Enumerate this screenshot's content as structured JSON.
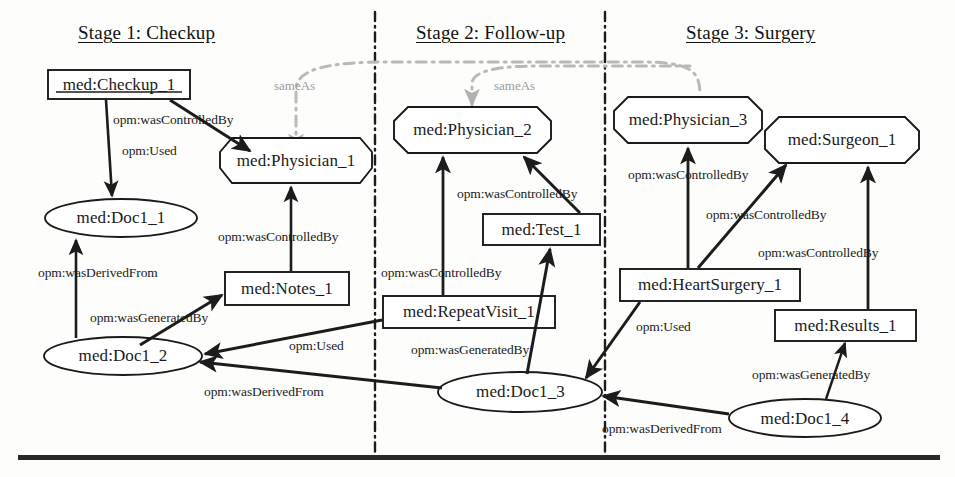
{
  "diagram": {
    "stages": [
      {
        "id": "stage1",
        "label": "Stage 1: Checkup",
        "x": 78,
        "y": 22
      },
      {
        "id": "stage2",
        "label": "Stage 2: Follow-up",
        "x": 416,
        "y": 22
      },
      {
        "id": "stage3",
        "label": "Stage 3: Surgery",
        "x": 686,
        "y": 22
      }
    ],
    "nodes": [
      {
        "id": "checkup1",
        "label": "med:Checkup_1",
        "shape": "rect",
        "x": 48,
        "y": 70,
        "w": 142,
        "h": 29,
        "underline": true
      },
      {
        "id": "physician1",
        "label": "med:Physician_1",
        "shape": "octagon",
        "x": 220,
        "y": 138,
        "w": 152,
        "h": 45
      },
      {
        "id": "doc1_1",
        "label": "med:Doc1_1",
        "shape": "ellipse",
        "x": 45,
        "y": 199,
        "w": 152,
        "h": 38
      },
      {
        "id": "notes1",
        "label": "med:Notes_1",
        "shape": "rect",
        "x": 225,
        "y": 272,
        "w": 124,
        "h": 33
      },
      {
        "id": "doc1_2",
        "label": "med:Doc1_2",
        "shape": "ellipse",
        "x": 44,
        "y": 337,
        "w": 158,
        "h": 38
      },
      {
        "id": "physician2",
        "label": "med:Physician_2",
        "shape": "octagon",
        "x": 394,
        "y": 107,
        "w": 157,
        "h": 46
      },
      {
        "id": "test1",
        "label": "med:Test_1",
        "shape": "rect",
        "x": 483,
        "y": 214,
        "w": 117,
        "h": 31
      },
      {
        "id": "repeatvisit1",
        "label": "med:RepeatVisit_1",
        "shape": "rect",
        "x": 383,
        "y": 296,
        "w": 172,
        "h": 32
      },
      {
        "id": "doc1_3",
        "label": "med:Doc1_3",
        "shape": "ellipse",
        "x": 438,
        "y": 372,
        "w": 165,
        "h": 40
      },
      {
        "id": "physician3",
        "label": "med:Physician_3",
        "shape": "octagon",
        "x": 614,
        "y": 97,
        "w": 148,
        "h": 46
      },
      {
        "id": "surgeon1",
        "label": "med:Surgeon_1",
        "shape": "octagon",
        "x": 765,
        "y": 117,
        "w": 154,
        "h": 46
      },
      {
        "id": "heartsurgery1",
        "label": "med:HeartSurgery_1",
        "shape": "rect",
        "x": 620,
        "y": 269,
        "w": 180,
        "h": 32
      },
      {
        "id": "results1",
        "label": "med:Results_1",
        "shape": "rect",
        "x": 775,
        "y": 310,
        "w": 141,
        "h": 31
      },
      {
        "id": "doc1_4",
        "label": "med:Doc1_4",
        "shape": "ellipse",
        "x": 729,
        "y": 399,
        "w": 152,
        "h": 39
      }
    ],
    "edges": [
      {
        "id": "e1",
        "from": "checkup1",
        "to": "doc1_1",
        "label": "opm:Used",
        "label_x": 122,
        "label_y": 143
      },
      {
        "id": "e2",
        "from": "checkup1",
        "to": "physician1",
        "label": "opm:wasControlledBy",
        "label_x": 113,
        "label_y": 112
      },
      {
        "id": "e3",
        "from": "notes1",
        "to": "physician1",
        "label": "opm:wasControlledBy",
        "label_x": 218,
        "label_y": 229
      },
      {
        "id": "e4",
        "from": "doc1_2",
        "to": "doc1_1",
        "label": "opm:wasDerivedFrom",
        "label_x": 38,
        "label_y": 265
      },
      {
        "id": "e5",
        "from": "doc1_2",
        "to": "notes1",
        "label": "opm:wasGeneratedBy",
        "label_x": 90,
        "label_y": 310
      },
      {
        "id": "e6",
        "from": "repeatvisit1",
        "to": "doc1_2",
        "label": "opm:Used",
        "label_x": 289,
        "label_y": 338
      },
      {
        "id": "e7",
        "from": "repeatvisit1",
        "to": "physician2",
        "label": "opm:wasControlledBy",
        "label_x": 381,
        "label_y": 265
      },
      {
        "id": "e8",
        "from": "test1",
        "to": "physician2",
        "label": "opm:wasControlledBy",
        "label_x": 457,
        "label_y": 186
      },
      {
        "id": "e9",
        "from": "doc1_3",
        "to": "test1",
        "label": "opm:wasGeneratedBy",
        "label_x": 411,
        "label_y": 342
      },
      {
        "id": "e10",
        "from": "doc1_3",
        "to": "doc1_2",
        "label": "opm:wasDerivedFrom",
        "label_x": 204,
        "label_y": 384
      },
      {
        "id": "e11",
        "from": "heartsurgery1",
        "to": "physician3",
        "label": "opm:wasControlledBy",
        "label_x": 628,
        "label_y": 167
      },
      {
        "id": "e12",
        "from": "heartsurgery1",
        "to": "surgeon1",
        "label": "opm:wasControlledBy",
        "label_x": 706,
        "label_y": 207
      },
      {
        "id": "e13",
        "from": "results1",
        "to": "surgeon1",
        "label": "opm:wasControlledBy",
        "label_x": 758,
        "label_y": 245
      },
      {
        "id": "e14",
        "from": "heartsurgery1",
        "to": "doc1_3",
        "label": "opm:Used",
        "label_x": 636,
        "label_y": 319
      },
      {
        "id": "e15",
        "from": "doc1_4",
        "to": "results1",
        "label": "opm:wasGeneratedBy",
        "label_x": 752,
        "label_y": 367
      },
      {
        "id": "e16",
        "from": "doc1_4",
        "to": "doc1_3",
        "label": "opm:wasDerivedFrom",
        "label_x": 602,
        "label_y": 421
      }
    ],
    "sameas_links": [
      {
        "id": "sameas1",
        "label": "sameAs",
        "label_x": 274,
        "label_y": 78,
        "from": "physician1",
        "to": "physician3"
      },
      {
        "id": "sameas2",
        "label": "sameAs",
        "label_x": 494,
        "label_y": 78,
        "from": "physician2",
        "to": "physician3"
      }
    ],
    "stage_dividers": [
      {
        "id": "divider-1-2",
        "x": 375
      },
      {
        "id": "divider-2-3",
        "x": 605
      }
    ],
    "colors": {
      "node_stroke": "#1a1a1a",
      "node_fill": "#ffffff",
      "edge": "#1c1c1c",
      "sameas": "#b0b0b0",
      "divider": "#1c1c1c",
      "text": "#111111",
      "background": "#fdfdfb"
    }
  }
}
